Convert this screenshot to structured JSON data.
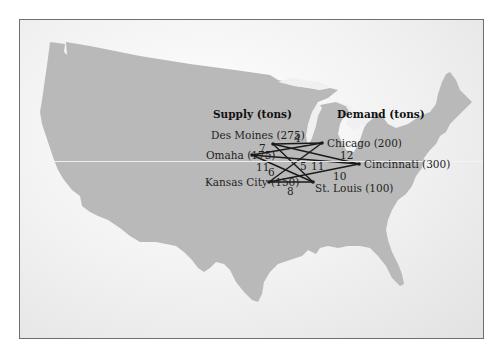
{
  "diagram": {
    "type": "transportation-network-map",
    "headers": {
      "supply": "Supply (tons)",
      "demand": "Demand (tons)"
    },
    "supply_nodes": [
      {
        "id": "des-moines",
        "label": "Des Moines (275)",
        "city": "Des Moines",
        "supply": 275
      },
      {
        "id": "omaha",
        "label": "Omaha (175)",
        "city": "Omaha",
        "supply": 175
      },
      {
        "id": "kansas-city",
        "label": "Kansas City (150)",
        "city": "Kansas City",
        "supply": 150
      }
    ],
    "demand_nodes": [
      {
        "id": "chicago",
        "label": "Chicago (200)",
        "city": "Chicago",
        "demand": 200
      },
      {
        "id": "cincinnati",
        "label": "Cincinnati (300)",
        "city": "Cincinnati",
        "demand": 300
      },
      {
        "id": "st-louis",
        "label": "St. Louis (100)",
        "city": "St. Louis",
        "demand": 100
      }
    ],
    "edge_cost_labels": [
      "4",
      "7",
      "12",
      "11",
      "6",
      "5",
      "11",
      "10",
      "8"
    ],
    "colors": {
      "land": "#b9b9b9",
      "water": "#f0f0f0",
      "lines": "#1a1a1a",
      "frame": "#6e6e6e"
    }
  }
}
